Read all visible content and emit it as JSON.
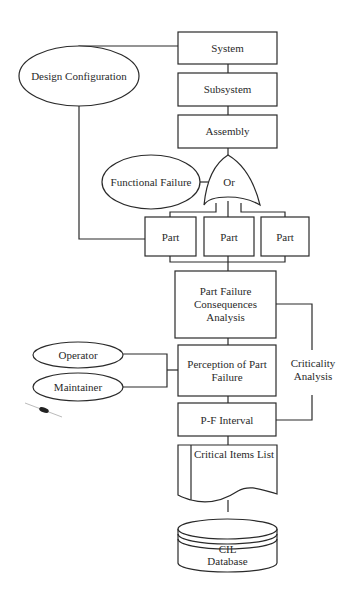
{
  "diagram": {
    "hierarchy": {
      "system": "System",
      "subsystem": "Subsystem",
      "assembly": "Assembly"
    },
    "design_configuration": "Design Configuration",
    "functional_failure": "Functional Failure",
    "gate": "Or",
    "parts": [
      "Part",
      "Part",
      "Part"
    ],
    "part_failure_consequences": [
      "Part Failure",
      "Consequences",
      "Analysis"
    ],
    "perception": [
      "Perception of Part",
      "Failure"
    ],
    "operator": "Operator",
    "maintainer": "Maintainer",
    "pf_interval": "P-F Interval",
    "criticality_analysis": [
      "Criticality",
      "Analysis"
    ],
    "critical_items_list": "Critical Items List",
    "database": [
      "CIL",
      "Database"
    ]
  }
}
